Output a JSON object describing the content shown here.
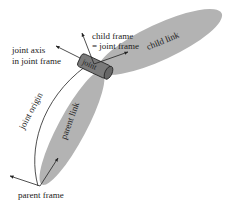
{
  "diagram": {
    "colors": {
      "link_fill": "#b3b3b3",
      "joint_fill": "#7a7a7a",
      "line": "#222222",
      "text": "#222222"
    },
    "labels": {
      "child_frame_line1": "child frame",
      "child_frame_line2": "= joint frame",
      "joint_axis_line1": "joint axis",
      "joint_axis_line2": "in joint frame",
      "joint": "joint",
      "child_link": "child link",
      "parent_link": "parent link",
      "joint_origin": "joint origin",
      "parent_frame": "parent frame"
    },
    "elements": [
      "child-link",
      "parent-link",
      "joint",
      "parent-frame-axes",
      "child-frame-axes",
      "joint-axis-arrow",
      "joint-origin-arc"
    ]
  }
}
